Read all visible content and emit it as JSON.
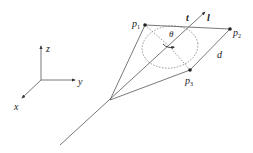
{
  "figure": {
    "type": "geometric-diagram",
    "coordinate_frame": {
      "axes": [
        {
          "label": "z",
          "direction": "up"
        },
        {
          "label": "y",
          "direction": "right"
        },
        {
          "label": "x",
          "direction": "down-left"
        }
      ]
    },
    "points": [
      {
        "id": "p1",
        "label": "p",
        "subscript": "1"
      },
      {
        "id": "p2",
        "label": "p",
        "subscript": "2"
      },
      {
        "id": "p3",
        "label": "p",
        "subscript": "3"
      }
    ],
    "labels": {
      "t": "t",
      "l": "l",
      "theta": "θ",
      "d": "d"
    },
    "colors": {
      "line": "#555555",
      "dashed": "#777777",
      "text": "#222222",
      "background": "#ffffff"
    }
  }
}
